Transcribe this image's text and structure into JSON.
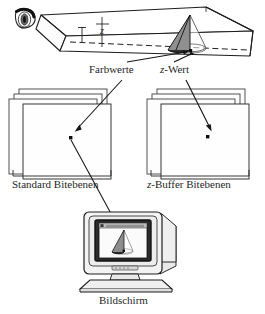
{
  "figure": {
    "language": "de",
    "background_color": "#ffffff",
    "ink_color": "#1a1a1a",
    "plane_fill": "#fdfdfd",
    "plane_stroke": "#555555",
    "cone_fill": "#8a8a8a",
    "monitor_fill": "#f2f2f2"
  },
  "labels": {
    "farbwerte": "Farbwerte",
    "z_wert_prefix": "z",
    "z_wert_suffix": "-Wert",
    "standard_bitebenen": "Standard Bitebenen",
    "zbuffer_prefix": "z",
    "zbuffer_suffix": "-Buffer Bitebenen",
    "bildschirm": "Bildschirm",
    "z_axis": "z"
  },
  "scene": {
    "eye_icon": "eye-icon",
    "frustum_name": "viewing-frustum",
    "cone_name": "cone-object",
    "sample_point_name": "sample-point"
  },
  "stacks": {
    "left": {
      "name": "standard-bitplanes",
      "plane_count": 4,
      "has_pixel_dot": true
    },
    "right": {
      "name": "zbuffer-bitplanes",
      "plane_count": 4,
      "has_pixel_dot": true
    }
  },
  "monitor": {
    "name": "crt-monitor",
    "screen_content": "rendered-cone",
    "has_titlebar": true
  }
}
